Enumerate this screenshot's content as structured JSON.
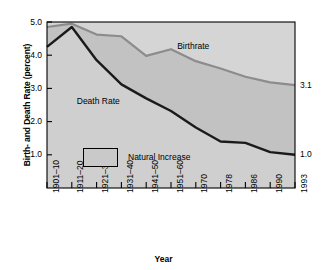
{
  "chart_data": {
    "type": "area",
    "title": "",
    "xlabel": "Year",
    "ylabel": "Birth- and Death Rate (percent)",
    "ylim": [
      0,
      5.0
    ],
    "grid": false,
    "legend_position": "inside-lower-left",
    "categories": [
      "1901–10",
      "1911–20",
      "1921–30",
      "1931–40",
      "1941–50",
      "1951–60",
      "1970",
      "1978",
      "1986",
      "1990",
      "1993"
    ],
    "yticks": [
      "1.0",
      "2.0",
      "3.0",
      "4.0",
      "5.0"
    ],
    "ytick_values": [
      1.0,
      2.0,
      3.0,
      4.0,
      5.0
    ],
    "series": [
      {
        "name": "Birthrate",
        "color": "#8c8c8c",
        "values": [
          4.85,
          4.95,
          4.62,
          4.57,
          3.98,
          4.18,
          3.82,
          3.6,
          3.35,
          3.18,
          3.1
        ]
      },
      {
        "name": "Death Rate",
        "color": "#1a1a1a",
        "values": [
          4.25,
          4.85,
          3.85,
          3.12,
          2.7,
          2.32,
          1.82,
          1.4,
          1.36,
          1.08,
          1.0
        ]
      }
    ],
    "annotations": [
      {
        "text": "Birthrate",
        "x_frac": 0.525,
        "y_px": 41
      },
      {
        "text": "Death Rate",
        "x_frac": 0.12,
        "y_px": 96
      }
    ],
    "end_labels": [
      {
        "text": "3.1",
        "series": "Birthrate"
      },
      {
        "text": "1.0",
        "series": "Death Rate"
      }
    ],
    "legend": {
      "swatch_fill": "#c9c9c9",
      "swatch_border": "#000000",
      "label": "Natural Increase"
    },
    "colors": {
      "plot_background": "#d5d5d5",
      "area_below_death": "#cfcfcf",
      "area_natural_increase": "#c2c2c2",
      "frame": "#000000",
      "page_background": "#ffffff"
    }
  }
}
